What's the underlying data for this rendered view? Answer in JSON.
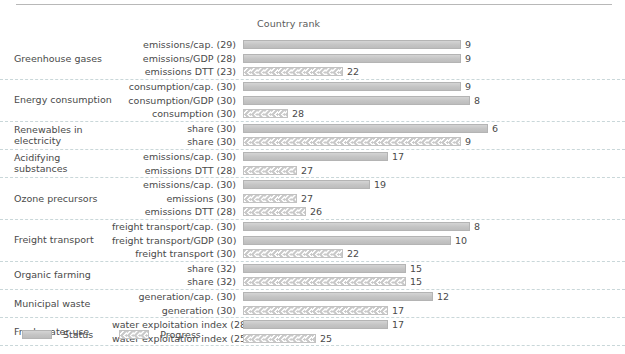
{
  "chart_data": {
    "type": "bar",
    "title": "",
    "xlabel": "Country rank",
    "ylabel": "",
    "axis_title": "Country rank",
    "orientation": "horizontal",
    "value_scale_max": 32,
    "grid": "dashed separators between groups",
    "legend_position": "bottom-left",
    "legend": [
      {
        "key": "status",
        "label": "Status",
        "style": "solid-gray-fill"
      },
      {
        "key": "progress",
        "label": "Progress",
        "style": "chevron-hatch"
      }
    ],
    "groups": [
      {
        "name": "Greenhouse gases",
        "rows": [
          {
            "label": "emissions/cap. (29)",
            "series": "Status",
            "value": 9,
            "total": 29
          },
          {
            "label": "emissions/GDP (28)",
            "series": "Status",
            "value": 9,
            "total": 28
          },
          {
            "label": "emissions DTT (23)",
            "series": "Progress",
            "value": 22,
            "total": 23
          }
        ]
      },
      {
        "name": "Energy consumption",
        "rows": [
          {
            "label": "consumption/cap. (30)",
            "series": "Status",
            "value": 9,
            "total": 30
          },
          {
            "label": "consumption/GDP (30)",
            "series": "Status",
            "value": 8,
            "total": 30
          },
          {
            "label": "consumption (30)",
            "series": "Progress",
            "value": 28,
            "total": 30
          }
        ]
      },
      {
        "name": "Renewables in electricity",
        "rows": [
          {
            "label": "share (30)",
            "series": "Status",
            "value": 6,
            "total": 30
          },
          {
            "label": "share (30)",
            "series": "Progress",
            "value": 9,
            "total": 30
          }
        ]
      },
      {
        "name": "Acidifying substances",
        "rows": [
          {
            "label": "emissions/cap. (30)",
            "series": "Status",
            "value": 17,
            "total": 30
          },
          {
            "label": "emissions DTT (28)",
            "series": "Progress",
            "value": 27,
            "total": 28
          }
        ]
      },
      {
        "name": "Ozone precursors",
        "rows": [
          {
            "label": "emissions/cap. (30)",
            "series": "Status",
            "value": 19,
            "total": 30
          },
          {
            "label": "emissions (30)",
            "series": "Progress",
            "value": 27,
            "total": 30
          },
          {
            "label": "emissions DTT (28)",
            "series": "Progress",
            "value": 26,
            "total": 28
          }
        ]
      },
      {
        "name": "Freight transport",
        "rows": [
          {
            "label": "freight transport/cap. (30)",
            "series": "Status",
            "value": 8,
            "total": 30
          },
          {
            "label": "freight transport/GDP (30)",
            "series": "Status",
            "value": 10,
            "total": 30
          },
          {
            "label": "freight transport (30)",
            "series": "Progress",
            "value": 22,
            "total": 30
          }
        ]
      },
      {
        "name": "Organic farming",
        "rows": [
          {
            "label": "share (32)",
            "series": "Status",
            "value": 15,
            "total": 32
          },
          {
            "label": "share (32)",
            "series": "Progress",
            "value": 15,
            "total": 32
          }
        ]
      },
      {
        "name": "Municipal waste",
        "rows": [
          {
            "label": "generation/cap. (30)",
            "series": "Status",
            "value": 12,
            "total": 30
          },
          {
            "label": "generation (30)",
            "series": "Progress",
            "value": 17,
            "total": 30
          }
        ]
      },
      {
        "name": "Fresh water use",
        "rows": [
          {
            "label": "water exploitation index (28)",
            "series": "Status",
            "value": 17,
            "total": 28
          },
          {
            "label": "water exploitation index (25)",
            "series": "Progress",
            "value": 25,
            "total": 25
          }
        ]
      }
    ]
  },
  "colors": {
    "status_fill": "#c8c8c8",
    "status_border": "#b4b4b4",
    "progress_fill": "#c9c9c9",
    "progress_border": "#c2c2c2",
    "text": "#4a4a4a",
    "separator": "#c9d7d9",
    "rule": "#b8b8b8"
  }
}
